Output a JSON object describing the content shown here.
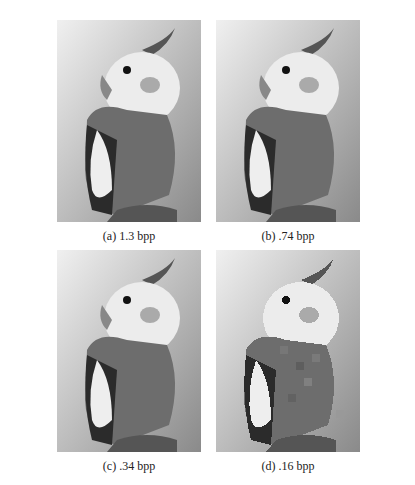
{
  "figure": {
    "panels": [
      {
        "id": "a",
        "caption": "(a) 1.3 bpp",
        "bitrate": "1.3 bpp",
        "subject": "cockatiel photograph",
        "blockiness": 0
      },
      {
        "id": "b",
        "caption": "(b) .74 bpp",
        "bitrate": ".74 bpp",
        "subject": "cockatiel photograph",
        "blockiness": 1
      },
      {
        "id": "c",
        "caption": "(c) .34 bpp",
        "bitrate": ".34 bpp",
        "subject": "cockatiel photograph",
        "blockiness": 2
      },
      {
        "id": "d",
        "caption": "(d) .16 bpp",
        "bitrate": ".16 bpp",
        "subject": "cockatiel photograph",
        "blockiness": 3
      }
    ]
  }
}
